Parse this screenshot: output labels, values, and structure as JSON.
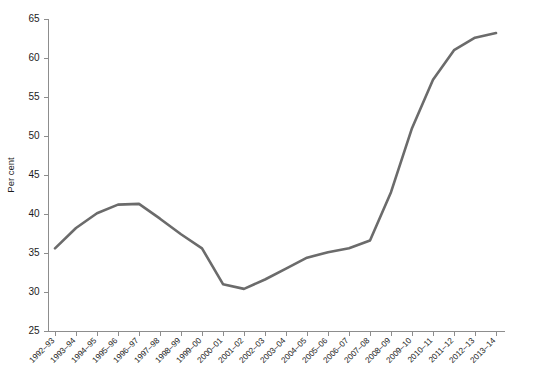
{
  "chart_data": {
    "type": "line",
    "title": "",
    "subtitle": "",
    "xlabel": "",
    "ylabel": "Per cent",
    "ylim": [
      25,
      65
    ],
    "yticks": [
      25,
      30,
      35,
      40,
      45,
      50,
      55,
      60,
      65
    ],
    "grid": false,
    "legend": null,
    "legend_position": "none",
    "line_color": "#6b6b6b",
    "axis_color": "#8d8d8d",
    "text_color": "#1c1c1c",
    "categories": [
      "1992–93",
      "1993–94",
      "1994–95",
      "1995–96",
      "1996–97",
      "1997–98",
      "1998–99",
      "1999–00",
      "2000–01",
      "2001–02",
      "2002–03",
      "2003–04",
      "2004–05",
      "2005–06",
      "2006–07",
      "2007–08",
      "2008–09",
      "2009–10",
      "2010–11",
      "2011–12",
      "2012–13",
      "2013–14"
    ],
    "values": [
      35.6,
      38.2,
      40.1,
      41.2,
      41.3,
      39.4,
      37.4,
      35.6,
      31.0,
      30.4,
      31.6,
      33.0,
      34.4,
      35.1,
      35.6,
      36.6,
      42.8,
      51.0,
      57.2,
      61.0,
      62.6,
      63.2
    ]
  }
}
